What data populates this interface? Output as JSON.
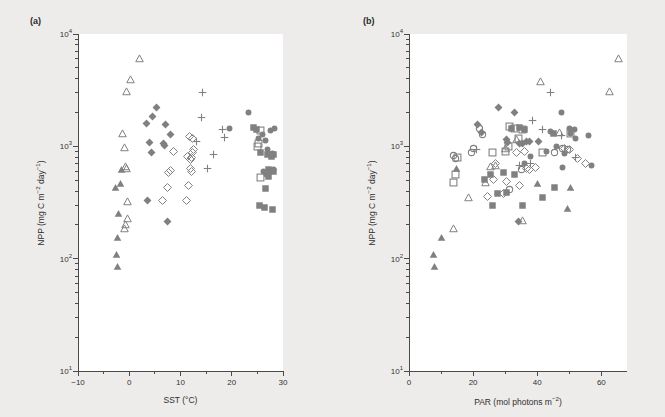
{
  "figure": {
    "background_color": "#eeecea",
    "plot_background_color": "#ffffff",
    "marker_color": "#808080",
    "axis_color": "#4a4a4a"
  },
  "chart_data": [
    {
      "type": "scatter",
      "panel": "a",
      "panel_label": "(a)",
      "title": "",
      "xlabel": "SST (°C)",
      "ylabel": "NPP (mg C m⁻² day⁻¹)",
      "xlabel_text": "SST",
      "xlabel_unit": "°C",
      "xscale": "linear",
      "yscale": "log",
      "xlim": [
        -10,
        30
      ],
      "ylim": [
        10,
        10000
      ],
      "xticks": [
        -10,
        0,
        10,
        20,
        30
      ],
      "xticklabels": [
        "−10",
        "0",
        "10",
        "20",
        "30"
      ],
      "yticks": [
        10,
        100,
        1000,
        10000
      ],
      "yticklabels": [
        "10¹",
        "10²",
        "10³",
        "10⁴"
      ],
      "grid": false,
      "legend": "none",
      "series": [
        {
          "name": "open-triangle",
          "marker": "triangle-open",
          "points": [
            [
              2.0,
              6000
            ],
            [
              0.2,
              3900
            ],
            [
              -0.6,
              3100
            ],
            [
              -1.3,
              1300
            ],
            [
              -0.9,
              980
            ],
            [
              -0.7,
              660
            ],
            [
              -0.6,
              640
            ],
            [
              -0.3,
              320
            ],
            [
              -0.4,
              230
            ],
            [
              -0.7,
              200
            ],
            [
              -1.0,
              185
            ]
          ]
        },
        {
          "name": "filled-triangle",
          "marker": "triangle-filled",
          "points": [
            [
              -1.6,
              620
            ],
            [
              -2.6,
              430
            ],
            [
              -1.8,
              470
            ],
            [
              -2.1,
              250
            ],
            [
              -2.3,
              155
            ],
            [
              -2.4,
              108
            ],
            [
              -2.3,
              86
            ]
          ]
        },
        {
          "name": "filled-diamond",
          "marker": "diamond-filled",
          "points": [
            [
              5.3,
              2200
            ],
            [
              4.6,
              1850
            ],
            [
              3.4,
              1600
            ],
            [
              7.0,
              1580
            ],
            [
              8.0,
              1270
            ],
            [
              4.0,
              1080
            ],
            [
              6.6,
              1060
            ],
            [
              6.9,
              1020
            ],
            [
              4.3,
              880
            ],
            [
              3.6,
              330
            ],
            [
              7.4,
              215
            ]
          ]
        },
        {
          "name": "open-diamond",
          "marker": "diamond-open",
          "points": [
            [
              11.8,
              1230
            ],
            [
              12.3,
              1180
            ],
            [
              8.6,
              900
            ],
            [
              11.4,
              820
            ],
            [
              12.2,
              800
            ],
            [
              11.9,
              760
            ],
            [
              12.3,
              880
            ],
            [
              12.6,
              930
            ],
            [
              8.0,
              610
            ],
            [
              7.7,
              580
            ],
            [
              12.0,
              640
            ],
            [
              12.1,
              600
            ],
            [
              11.5,
              450
            ],
            [
              7.4,
              430
            ],
            [
              6.4,
              330
            ],
            [
              11.2,
              330
            ]
          ]
        },
        {
          "name": "plus",
          "marker": "plus",
          "points": [
            [
              14.2,
              3000
            ],
            [
              14.0,
              1800
            ],
            [
              18.2,
              1400
            ],
            [
              18.6,
              1200
            ],
            [
              13.2,
              1100
            ],
            [
              16.4,
              850
            ],
            [
              15.3,
              640
            ]
          ]
        },
        {
          "name": "filled-circle",
          "marker": "circle-filled",
          "points": [
            [
              23.2,
              2000
            ],
            [
              19.6,
              1430
            ],
            [
              28.3,
              1450
            ],
            [
              27.5,
              1390
            ],
            [
              26.0,
              1280
            ],
            [
              26.6,
              1130
            ],
            [
              26.9,
              940
            ],
            [
              28.0,
              870
            ],
            [
              27.7,
              840
            ],
            [
              26.2,
              600
            ],
            [
              27.3,
              580
            ],
            [
              28.1,
              620
            ],
            [
              26.8,
              560
            ],
            [
              25.3,
              1180
            ]
          ]
        },
        {
          "name": "filled-square",
          "marker": "square-filled",
          "points": [
            [
              24.3,
              1480
            ],
            [
              24.9,
              1420
            ],
            [
              27.0,
              850
            ],
            [
              28.2,
              840
            ],
            [
              27.8,
              810
            ],
            [
              25.6,
              880
            ],
            [
              27.2,
              620
            ],
            [
              28.2,
              600
            ],
            [
              27.1,
              540
            ],
            [
              26.6,
              420
            ],
            [
              25.5,
              295
            ],
            [
              26.4,
              285
            ],
            [
              28.0,
              275
            ]
          ]
        },
        {
          "name": "open-square",
          "marker": "square-open",
          "points": [
            [
              25.6,
              1380
            ],
            [
              25.2,
              1050
            ],
            [
              25.0,
              990
            ],
            [
              25.7,
              530
            ]
          ]
        }
      ]
    },
    {
      "type": "scatter",
      "panel": "b",
      "panel_label": "(b)",
      "title": "",
      "xlabel": "PAR (mol photons m⁻²)",
      "ylabel": "NPP (mg C m⁻² day⁻¹)",
      "xlabel_text": "PAR",
      "xlabel_unit": "mol photons m⁻²",
      "xscale": "linear",
      "yscale": "log",
      "xlim": [
        0,
        68
      ],
      "ylim": [
        10,
        10000
      ],
      "xticks": [
        0,
        20,
        40,
        60
      ],
      "xticklabels": [
        "0",
        "20",
        "40",
        "60"
      ],
      "yticks": [
        10,
        100,
        1000,
        10000
      ],
      "yticklabels": [
        "10¹",
        "10²",
        "10³",
        "10⁴"
      ],
      "grid": false,
      "legend": "none",
      "series": [
        {
          "name": "open-triangle",
          "marker": "triangle-open",
          "points": [
            [
              65.5,
              6000
            ],
            [
              62.5,
              3100
            ],
            [
              41.0,
              3800
            ],
            [
              47.0,
              1330
            ],
            [
              33.5,
              1150
            ],
            [
              30.0,
              950
            ],
            [
              27.0,
              680
            ],
            [
              25.5,
              660
            ],
            [
              24.0,
              480
            ],
            [
              18.5,
              350
            ],
            [
              14.0,
              185
            ],
            [
              35.5,
              220
            ]
          ]
        },
        {
          "name": "filled-triangle",
          "marker": "triangle-filled",
          "points": [
            [
              50.5,
              430
            ],
            [
              40.0,
              470
            ],
            [
              49.5,
              280
            ],
            [
              10.0,
              155
            ],
            [
              7.6,
              108
            ],
            [
              7.8,
              86
            ],
            [
              14.8,
              640
            ]
          ]
        },
        {
          "name": "filled-diamond",
          "marker": "diamond-filled",
          "points": [
            [
              27.8,
              2200
            ],
            [
              33.0,
              2000
            ],
            [
              40.5,
              1100
            ],
            [
              36.5,
              1110
            ],
            [
              37.5,
              1100
            ],
            [
              30.3,
              1150
            ],
            [
              30.8,
              1080
            ],
            [
              34.5,
              1060
            ],
            [
              21.5,
              1570
            ],
            [
              22.5,
              1320
            ],
            [
              35.5,
              1060
            ],
            [
              34.0,
              215
            ]
          ]
        },
        {
          "name": "open-diamond",
          "marker": "diamond-open",
          "points": [
            [
              36.0,
              900
            ],
            [
              33.5,
              880
            ],
            [
              48.5,
              960
            ],
            [
              50.0,
              930
            ],
            [
              27.0,
              700
            ],
            [
              39.5,
              650
            ],
            [
              36.8,
              640
            ],
            [
              30.5,
              490
            ],
            [
              24.5,
              360
            ],
            [
              29.5,
              380
            ],
            [
              34.5,
              450
            ],
            [
              26.5,
              510
            ],
            [
              52.5,
              780
            ],
            [
              55.0,
              700
            ],
            [
              37.5,
              620
            ]
          ]
        },
        {
          "name": "plus",
          "marker": "plus",
          "points": [
            [
              44.0,
              3000
            ],
            [
              38.5,
              1700
            ],
            [
              41.5,
              1400
            ],
            [
              47.5,
              1250
            ],
            [
              21.0,
              940
            ],
            [
              38.0,
              700
            ],
            [
              34.5,
              680
            ],
            [
              52.0,
              800
            ]
          ]
        },
        {
          "name": "filled-circle",
          "marker": "circle-filled",
          "points": [
            [
              47.5,
              2000
            ],
            [
              44.0,
              1350
            ],
            [
              50.0,
              1450
            ],
            [
              51.5,
              1400
            ],
            [
              50.5,
              1300
            ],
            [
              56.0,
              1250
            ],
            [
              46.0,
              1000
            ],
            [
              43.0,
              900
            ],
            [
              48.5,
              870
            ],
            [
              38.0,
              820
            ],
            [
              36.0,
              700
            ],
            [
              48.0,
              650
            ],
            [
              57.0,
              680
            ],
            [
              52.0,
              1180
            ]
          ]
        },
        {
          "name": "filled-square",
          "marker": "square-filled",
          "points": [
            [
              34.5,
              1480
            ],
            [
              36.0,
              1420
            ],
            [
              45.0,
              1300
            ],
            [
              32.0,
              1450
            ],
            [
              29.5,
              580
            ],
            [
              33.0,
              560
            ],
            [
              25.5,
              560
            ],
            [
              27.5,
              380
            ],
            [
              30.5,
              390
            ],
            [
              41.5,
              350
            ],
            [
              26.0,
              300
            ],
            [
              35.5,
              300
            ],
            [
              45.5,
              430
            ],
            [
              23.5,
              510
            ]
          ]
        },
        {
          "name": "open-square",
          "marker": "square-open",
          "points": [
            [
              31.5,
              1500
            ],
            [
              33.0,
              1450
            ],
            [
              35.5,
              1420
            ],
            [
              34.0,
              1180
            ],
            [
              31.0,
              1000
            ],
            [
              41.5,
              880
            ],
            [
              30.0,
              900
            ],
            [
              26.0,
              880
            ],
            [
              15.0,
              800
            ],
            [
              14.5,
              560
            ],
            [
              14.0,
              480
            ],
            [
              50.5,
              1300
            ]
          ]
        },
        {
          "name": "open-circle",
          "marker": "circle-open",
          "points": [
            [
              22.0,
              1450
            ],
            [
              23.0,
              1280
            ],
            [
              20.0,
              960
            ],
            [
              19.5,
              880
            ],
            [
              14.0,
              830
            ],
            [
              14.5,
              780
            ],
            [
              48.0,
              950
            ],
            [
              49.5,
              930
            ],
            [
              45.5,
              880
            ],
            [
              35.0,
              620
            ],
            [
              31.5,
              410
            ]
          ]
        }
      ]
    }
  ]
}
